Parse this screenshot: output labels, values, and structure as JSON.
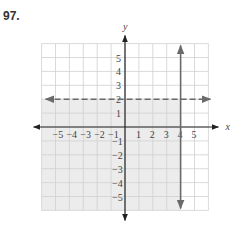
{
  "problem_number": "97.",
  "chart_data": {
    "type": "inequality-graph",
    "title": "",
    "xlabel": "x",
    "ylabel": "y",
    "xlim": [
      -6,
      6
    ],
    "ylim": [
      -6,
      6
    ],
    "grid": true,
    "x_ticks": [
      "-5",
      "-4",
      "-3",
      "-2",
      "-1",
      "1",
      "2",
      "3",
      "4",
      "5"
    ],
    "y_ticks": [
      "5",
      "4",
      "3",
      "2",
      "1",
      "-1",
      "-2",
      "-3",
      "-4",
      "-5"
    ],
    "boundaries": [
      {
        "equation": "y = 2",
        "style": "dashed",
        "orientation": "horizontal",
        "value": 2
      },
      {
        "equation": "x = 4",
        "style": "solid",
        "orientation": "vertical",
        "value": 4
      }
    ],
    "shaded_region": "x <= 4 and y < 2",
    "colors": {
      "grid": "#d0d0d0",
      "shade": "#ececec",
      "axis": "#222222",
      "boundary": "#6a6a6a"
    }
  }
}
